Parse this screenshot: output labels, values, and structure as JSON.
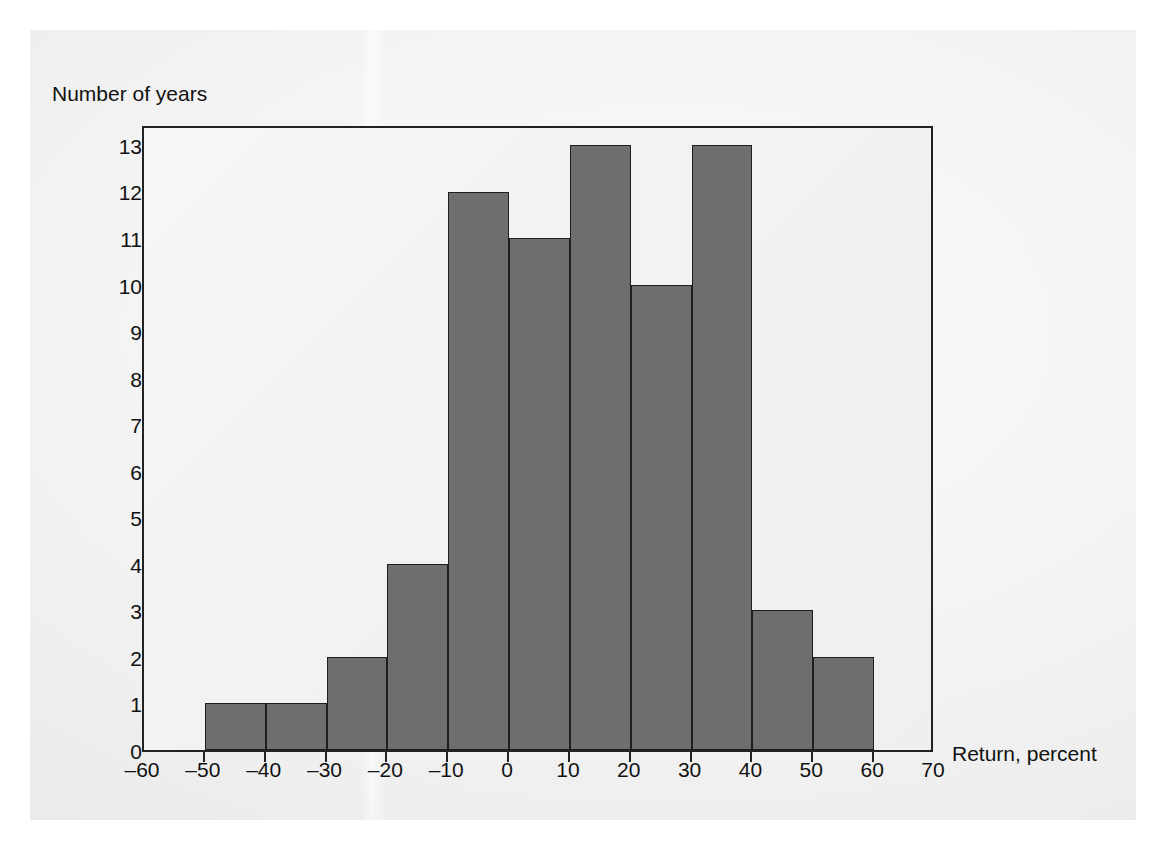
{
  "figure": {
    "y_axis_title": "Number of years",
    "x_axis_title": "Return, percent",
    "bar_color": "#6e6e6e",
    "bar_edge_color": "#1e1e1e",
    "frame_color": "#222222",
    "plot_background": "#f2f2f2"
  },
  "chart_data": {
    "type": "bar",
    "title": "",
    "xlabel": "Return, percent",
    "ylabel": "Number of years",
    "xlim": [
      -60,
      70
    ],
    "ylim": [
      0,
      13.45
    ],
    "grid": false,
    "legend": null,
    "bin_width": 10,
    "bin_edges": [
      -60,
      -50,
      -40,
      -30,
      -20,
      -10,
      0,
      10,
      20,
      30,
      40,
      50,
      60,
      70
    ],
    "categories": [
      "-60 to -50",
      "-50 to -40",
      "-40 to -30",
      "-30 to -20",
      "-20 to -10",
      "-10 to 0",
      "0 to 10",
      "10 to 20",
      "20 to 30",
      "30 to 40",
      "40 to 50",
      "50 to 60",
      "60 to 70"
    ],
    "values": [
      0,
      1,
      1,
      2,
      4,
      12,
      11,
      13,
      10,
      13,
      3,
      2,
      0
    ],
    "xticks": [
      -60,
      -50,
      -40,
      -30,
      -20,
      -10,
      0,
      10,
      20,
      30,
      40,
      50,
      60,
      70
    ],
    "xtick_labels": [
      "–60",
      "–50",
      "–40",
      "–30",
      "–20",
      "–10",
      "0",
      "10",
      "20",
      "30",
      "40",
      "50",
      "60",
      "70"
    ],
    "yticks": [
      0,
      1,
      2,
      3,
      4,
      5,
      6,
      7,
      8,
      9,
      10,
      11,
      12,
      13
    ],
    "ytick_labels": [
      "0",
      "1",
      "2",
      "3",
      "4",
      "5",
      "6",
      "7",
      "8",
      "9",
      "10",
      "11",
      "12",
      "13"
    ]
  }
}
